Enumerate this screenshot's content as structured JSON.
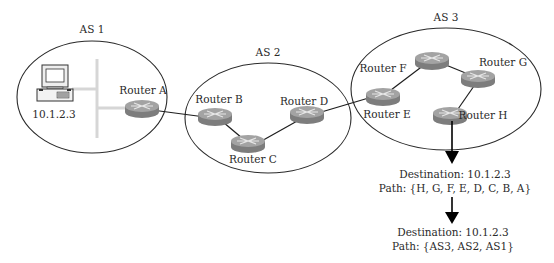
{
  "autonomous_systems": [
    {
      "id": "as1",
      "label": "AS 1",
      "cx": 92,
      "cy": 97,
      "rx": 75,
      "ry": 56,
      "label_x": 92,
      "label_y": 23
    },
    {
      "id": "as2",
      "label": "AS 2",
      "cx": 268,
      "cy": 118,
      "rx": 83,
      "ry": 55,
      "label_x": 268,
      "label_y": 46
    },
    {
      "id": "as3",
      "label": "AS 3",
      "cx": 446,
      "cy": 89,
      "rx": 95,
      "ry": 61,
      "label_x": 446,
      "label_y": 11
    }
  ],
  "host": {
    "label": "10.1.2.3",
    "x": 58,
    "y": 80
  },
  "routers": [
    {
      "id": "A",
      "label": "Router A",
      "x": 142,
      "y": 108,
      "label_x": 143,
      "label_y": 83
    },
    {
      "id": "B",
      "label": "Router B",
      "x": 215,
      "y": 116,
      "label_x": 219,
      "label_y": 92
    },
    {
      "id": "C",
      "label": "Router C",
      "x": 248,
      "y": 143,
      "label_x": 253,
      "label_y": 156
    },
    {
      "id": "D",
      "label": "Router D",
      "x": 307,
      "y": 114,
      "label_x": 304,
      "label_y": 94
    },
    {
      "id": "E",
      "label": "Router E",
      "x": 383,
      "y": 96,
      "label_x": 381,
      "label_y": 108
    },
    {
      "id": "F",
      "label": "Router F",
      "x": 432,
      "y": 60,
      "label_x": 388,
      "label_y": 62
    },
    {
      "id": "G",
      "label": "Router G",
      "x": 478,
      "y": 78,
      "label_x": 503,
      "label_y": 56
    },
    {
      "id": "H",
      "label": "Router H",
      "x": 450,
      "y": 115,
      "label_x": 481,
      "label_y": 109
    }
  ],
  "links": [
    [
      "A",
      "B"
    ],
    [
      "B",
      "C"
    ],
    [
      "C",
      "D"
    ],
    [
      "D",
      "E"
    ],
    [
      "E",
      "F"
    ],
    [
      "F",
      "G"
    ],
    [
      "G",
      "H"
    ]
  ],
  "advertisements": [
    {
      "destination": "Destination: 10.1.2.3",
      "path": "Path: {H, G, F, E, D, C, B, A}",
      "x": 455,
      "y": 171
    },
    {
      "destination": "Destination: 10.1.2.3",
      "path": "Path: {AS3, AS2, AS1}",
      "x": 453,
      "y": 227
    }
  ],
  "colors": {
    "outline": "#2a2a2a",
    "router_body": "#8c8c8c",
    "router_top": "#a9a9a9",
    "lan": "#d6d6d6"
  }
}
